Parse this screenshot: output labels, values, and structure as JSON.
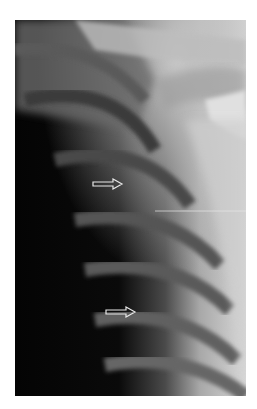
{
  "image": {
    "subject": "chest x-ray, right upper chest with clavicle and ribs",
    "annotations": [
      {
        "type": "arrow",
        "direction": "right",
        "x": 92,
        "y": 184
      },
      {
        "type": "arrow",
        "direction": "right",
        "x": 105,
        "y": 312
      }
    ]
  }
}
